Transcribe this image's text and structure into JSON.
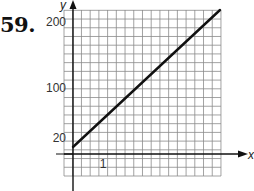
{
  "problem": {
    "number": "59."
  },
  "chart_data": {
    "type": "line",
    "title": "",
    "xlabel": "x",
    "ylabel": "y",
    "x_tick_labels": [
      "1"
    ],
    "y_tick_labels": [
      "20",
      "100",
      "200"
    ],
    "grid": true,
    "series": [
      {
        "name": "line",
        "x": [
          0,
          5.4
        ],
        "y": [
          10,
          218
        ]
      }
    ],
    "xlim": [
      -0.3,
      5.5
    ],
    "ylim": [
      -30,
      220
    ],
    "colors": {
      "line": "#111111",
      "grid": "#7a7a7a",
      "axis": "#111111"
    }
  }
}
